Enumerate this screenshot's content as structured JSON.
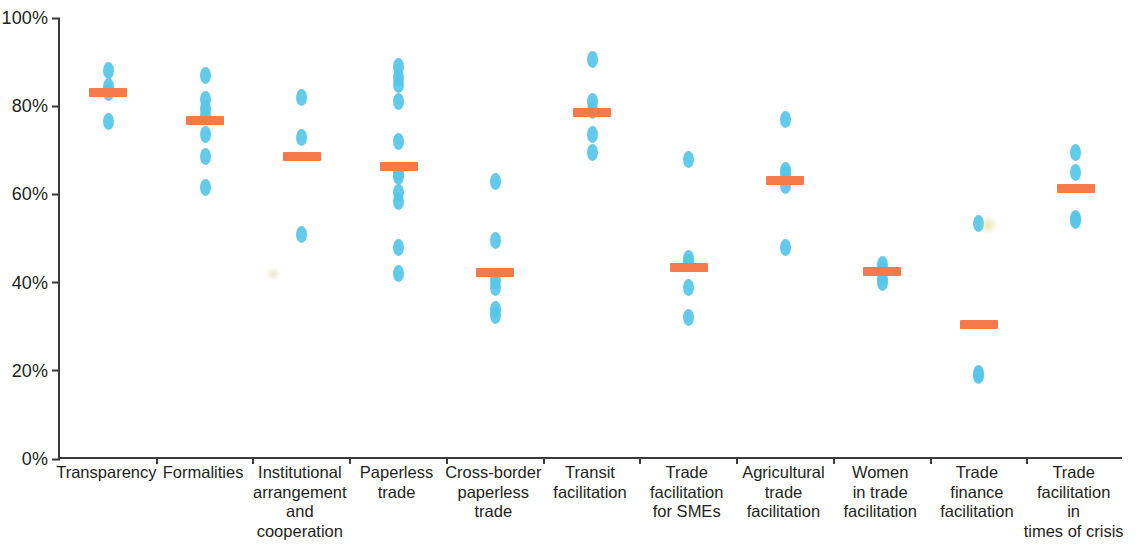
{
  "chart_data": {
    "type": "scatter",
    "title": "",
    "subtitle": "",
    "xlabel": "",
    "ylabel": "",
    "ylim": [
      0,
      100
    ],
    "y_unit": "%",
    "grid": false,
    "legend": "none",
    "y_ticks": [
      "0%",
      "20%",
      "40%",
      "60%",
      "80%",
      "100%"
    ],
    "y_tick_values": [
      0,
      20,
      40,
      60,
      80,
      100
    ],
    "marker_colors": {
      "dot": "#57c6e8",
      "mean_bar": "#f4794b",
      "axis": "#3b3b3b",
      "text": "#231f20",
      "background": "#ffffff"
    },
    "categories": [
      "Transparency",
      "Formalities",
      "Institutional\narrangement\nand\ncooperation",
      "Paperless\ntrade",
      "Cross-border\npaperless\ntrade",
      "Transit\nfacilitation",
      "Trade\nfacilitation\nfor SMEs",
      "Agricultural\ntrade\nfacilitation",
      "Women\nin trade\nfacilitation",
      "Trade\nfinance\nfacilitation",
      "Trade\nfacilitation\nin\ntimes of crisis"
    ],
    "series": [
      {
        "name": "Economy scores",
        "marker": "dot",
        "values": [
          [
            88.0,
            84.5,
            83.0,
            76.5
          ],
          [
            87.0,
            81.5,
            79.5,
            78.0,
            73.5,
            68.5,
            61.5
          ],
          [
            82.0,
            73.0,
            51.0
          ],
          [
            89.0,
            86.5,
            85.0,
            81.0,
            72.0,
            65.0,
            64.0,
            60.5,
            58.5,
            48.0,
            42.0
          ],
          [
            63.0,
            49.5,
            40.5,
            39.0,
            34.0,
            32.5
          ],
          [
            90.5,
            81.0,
            79.0,
            73.5,
            69.5
          ],
          [
            68.0,
            45.5,
            44.5,
            39.0,
            32.0
          ],
          [
            77.0,
            65.5,
            64.5,
            62.0,
            48.0
          ],
          [
            44.0,
            43.0,
            41.0,
            40.0
          ],
          [
            53.5,
            19.5,
            19.0
          ],
          [
            69.5,
            65.0,
            54.5,
            54.0
          ]
        ]
      },
      {
        "name": "Average",
        "marker": "mean-bar",
        "values": [
          83.0,
          76.8,
          68.6,
          66.4,
          42.3,
          78.6,
          43.4,
          63.1,
          42.5,
          30.4,
          61.3
        ]
      }
    ]
  }
}
